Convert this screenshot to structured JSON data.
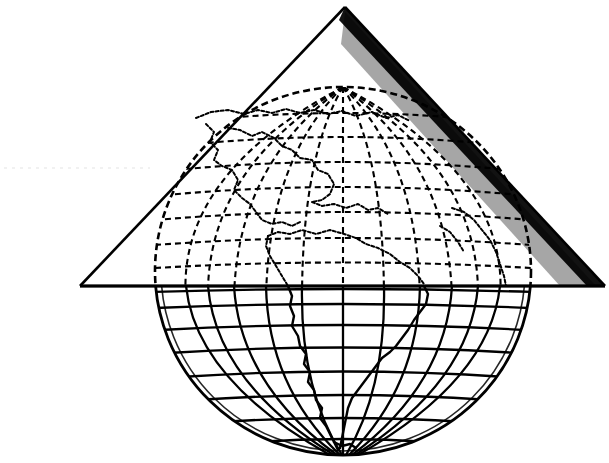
{
  "figure": {
    "caption": "",
    "domain": "diagram-cartography",
    "canvas": {
      "width": 609,
      "height": 463,
      "background": "#ffffff"
    },
    "colors": {
      "ink": "#000000",
      "paper": "#ffffff",
      "hatch": "#000000"
    }
  },
  "globe": {
    "label": "globe-wireframe",
    "center_x": 343,
    "center_y": 271,
    "radius_x": 188,
    "radius_y": 184,
    "outline_style": "solid",
    "hidden_line_style": "dashed",
    "dash_pattern": "6 4",
    "stroke_width": 2.2,
    "parallels": {
      "label": "latitude-lines",
      "count": 13,
      "spacing_degrees": 15,
      "y_positions": [
        125,
        143,
        167,
        190,
        215,
        242,
        286,
        305,
        327,
        350,
        375,
        400,
        425,
        445
      ],
      "solid_below_y": 286
    },
    "meridians": {
      "label": "longitude-lines",
      "count": 13,
      "spacing_degrees": 15,
      "central_meridian_x": 343
    },
    "landmasses": [
      {
        "name": "north-america",
        "region": "upper-left"
      },
      {
        "name": "central-america",
        "region": "center"
      },
      {
        "name": "caribbean",
        "region": "center-right"
      },
      {
        "name": "south-america",
        "region": "lower-center"
      },
      {
        "name": "africa-west-coast",
        "region": "right-edge"
      }
    ]
  },
  "cone": {
    "label": "projection-cone",
    "apex": {
      "x": 345,
      "y": 7
    },
    "base_left": {
      "x": 80,
      "y": 286
    },
    "base_right": {
      "x": 605,
      "y": 286
    },
    "outline_stroke_width": 2.4,
    "shading": {
      "side": "right",
      "style": "diagonal-hatching",
      "stroke_width": 1.1,
      "density": "dense-near-edge"
    },
    "standard_parallel_y": 286
  },
  "artifacts": {
    "scan_streak": {
      "y": 168,
      "x_start": 4,
      "x_end": 150,
      "opacity": 0.07
    }
  }
}
